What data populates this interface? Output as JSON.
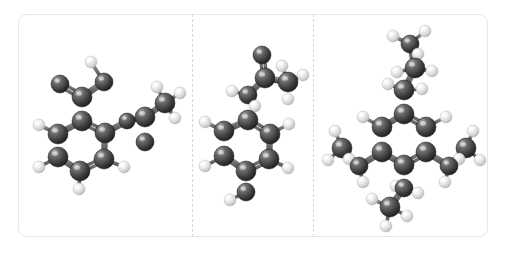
{
  "viewer": {
    "background_color": "#ffffff",
    "frame_border_color": "#e6e6e6",
    "divider_color": "#d8d8d8",
    "panel_count": 3
  },
  "atom_styles": {
    "carbon": {
      "label": "C",
      "color": "#3a3a3a",
      "highlight": "#8d8d8d",
      "radius": 9
    },
    "hydrogen": {
      "label": "H",
      "color": "#d8d8d8",
      "highlight": "#ffffff",
      "radius": 6
    },
    "bond_color": "#6e6e6e"
  },
  "panels": [
    {
      "name": "panel-1",
      "molecule_name": "molecule-1",
      "atoms": [
        {
          "id": "c1",
          "element": "C",
          "x": 82,
          "y": 121,
          "r": 10
        },
        {
          "id": "c2",
          "element": "C",
          "x": 58,
          "y": 134,
          "r": 10
        },
        {
          "id": "c3",
          "element": "C",
          "x": 58,
          "y": 157,
          "r": 10
        },
        {
          "id": "c4",
          "element": "C",
          "x": 80,
          "y": 171,
          "r": 10
        },
        {
          "id": "c5",
          "element": "C",
          "x": 104,
          "y": 159,
          "r": 10
        },
        {
          "id": "c6",
          "element": "C",
          "x": 105,
          "y": 133,
          "r": 10
        },
        {
          "id": "c7",
          "element": "C",
          "x": 82,
          "y": 97,
          "r": 10
        },
        {
          "id": "o1",
          "element": "C",
          "x": 60,
          "y": 84,
          "r": 9
        },
        {
          "id": "c8",
          "element": "C",
          "x": 104,
          "y": 82,
          "r": 9
        },
        {
          "id": "c9",
          "element": "C",
          "x": 127,
          "y": 121,
          "r": 8
        },
        {
          "id": "c10",
          "element": "C",
          "x": 145,
          "y": 117,
          "r": 10
        },
        {
          "id": "o2",
          "element": "C",
          "x": 145,
          "y": 142,
          "r": 9
        },
        {
          "id": "c11",
          "element": "C",
          "x": 165,
          "y": 103,
          "r": 10
        },
        {
          "id": "h1",
          "element": "H",
          "x": 39,
          "y": 125,
          "r": 6
        },
        {
          "id": "h2",
          "element": "H",
          "x": 39,
          "y": 167,
          "r": 6
        },
        {
          "id": "h3",
          "element": "H",
          "x": 79,
          "y": 189,
          "r": 6
        },
        {
          "id": "h4",
          "element": "H",
          "x": 124,
          "y": 167,
          "r": 6
        },
        {
          "id": "h5",
          "element": "H",
          "x": 91,
          "y": 62,
          "r": 6
        },
        {
          "id": "h6",
          "element": "H",
          "x": 157,
          "y": 87,
          "r": 6
        },
        {
          "id": "h7",
          "element": "H",
          "x": 180,
          "y": 93,
          "r": 6
        },
        {
          "id": "h8",
          "element": "H",
          "x": 175,
          "y": 118,
          "r": 6
        }
      ],
      "bonds": [
        {
          "a": "c1",
          "b": "c2",
          "order": 1
        },
        {
          "a": "c2",
          "b": "c3",
          "order": 2
        },
        {
          "a": "c3",
          "b": "c4",
          "order": 1
        },
        {
          "a": "c4",
          "b": "c5",
          "order": 2
        },
        {
          "a": "c5",
          "b": "c6",
          "order": 1
        },
        {
          "a": "c6",
          "b": "c1",
          "order": 2
        },
        {
          "a": "c1",
          "b": "c7",
          "order": 1
        },
        {
          "a": "c7",
          "b": "o1",
          "order": 2
        },
        {
          "a": "c7",
          "b": "c8",
          "order": 1
        },
        {
          "a": "c6",
          "b": "c9",
          "order": 1
        },
        {
          "a": "c9",
          "b": "c10",
          "order": 1
        },
        {
          "a": "c10",
          "b": "o2",
          "order": 2
        },
        {
          "a": "c10",
          "b": "c11",
          "order": 1
        },
        {
          "a": "c2",
          "b": "h1",
          "order": 1
        },
        {
          "a": "c3",
          "b": "h2",
          "order": 1
        },
        {
          "a": "c4",
          "b": "h3",
          "order": 1
        },
        {
          "a": "c5",
          "b": "h4",
          "order": 1
        },
        {
          "a": "c8",
          "b": "h5",
          "order": 1
        },
        {
          "a": "c11",
          "b": "h6",
          "order": 1
        },
        {
          "a": "c11",
          "b": "h7",
          "order": 1
        },
        {
          "a": "c11",
          "b": "h8",
          "order": 1
        }
      ]
    },
    {
      "name": "panel-2",
      "molecule_name": "molecule-2",
      "atoms": [
        {
          "id": "c1",
          "element": "C",
          "x": 248,
          "y": 120,
          "r": 10
        },
        {
          "id": "c2",
          "element": "C",
          "x": 224,
          "y": 131,
          "r": 10
        },
        {
          "id": "c3",
          "element": "C",
          "x": 224,
          "y": 156,
          "r": 10
        },
        {
          "id": "c4",
          "element": "C",
          "x": 246,
          "y": 171,
          "r": 10
        },
        {
          "id": "c5",
          "element": "C",
          "x": 269,
          "y": 159,
          "r": 10
        },
        {
          "id": "c6",
          "element": "C",
          "x": 270,
          "y": 134,
          "r": 10
        },
        {
          "id": "c7",
          "element": "C",
          "x": 248,
          "y": 95,
          "r": 9
        },
        {
          "id": "c8",
          "element": "C",
          "x": 265,
          "y": 78,
          "r": 10
        },
        {
          "id": "o1",
          "element": "C",
          "x": 262,
          "y": 55,
          "r": 9
        },
        {
          "id": "c9",
          "element": "C",
          "x": 288,
          "y": 82,
          "r": 10
        },
        {
          "id": "c10",
          "element": "C",
          "x": 246,
          "y": 192,
          "r": 9
        },
        {
          "id": "h1",
          "element": "H",
          "x": 205,
          "y": 122,
          "r": 6
        },
        {
          "id": "h2",
          "element": "H",
          "x": 205,
          "y": 166,
          "r": 6
        },
        {
          "id": "h3",
          "element": "H",
          "x": 288,
          "y": 168,
          "r": 6
        },
        {
          "id": "h4",
          "element": "H",
          "x": 289,
          "y": 124,
          "r": 6
        },
        {
          "id": "h5",
          "element": "H",
          "x": 232,
          "y": 91,
          "r": 6
        },
        {
          "id": "h6",
          "element": "H",
          "x": 255,
          "y": 106,
          "r": 6
        },
        {
          "id": "h7",
          "element": "H",
          "x": 282,
          "y": 66,
          "r": 6
        },
        {
          "id": "h8",
          "element": "H",
          "x": 303,
          "y": 75,
          "r": 6
        },
        {
          "id": "h9",
          "element": "H",
          "x": 288,
          "y": 99,
          "r": 6
        },
        {
          "id": "h10",
          "element": "H",
          "x": 230,
          "y": 200,
          "r": 6
        }
      ],
      "bonds": [
        {
          "a": "c1",
          "b": "c2",
          "order": 1
        },
        {
          "a": "c2",
          "b": "c3",
          "order": 2
        },
        {
          "a": "c3",
          "b": "c4",
          "order": 1
        },
        {
          "a": "c4",
          "b": "c5",
          "order": 2
        },
        {
          "a": "c5",
          "b": "c6",
          "order": 1
        },
        {
          "a": "c6",
          "b": "c1",
          "order": 2
        },
        {
          "a": "c1",
          "b": "c7",
          "order": 1
        },
        {
          "a": "c7",
          "b": "c8",
          "order": 1
        },
        {
          "a": "c8",
          "b": "o1",
          "order": 2
        },
        {
          "a": "c8",
          "b": "c9",
          "order": 1
        },
        {
          "a": "c4",
          "b": "c10",
          "order": 1
        },
        {
          "a": "c2",
          "b": "h1",
          "order": 1
        },
        {
          "a": "c3",
          "b": "h2",
          "order": 1
        },
        {
          "a": "c5",
          "b": "h3",
          "order": 1
        },
        {
          "a": "c6",
          "b": "h4",
          "order": 1
        },
        {
          "a": "c7",
          "b": "h5",
          "order": 1
        },
        {
          "a": "c7",
          "b": "h6",
          "order": 1
        },
        {
          "a": "c9",
          "b": "h7",
          "order": 1
        },
        {
          "a": "c9",
          "b": "h8",
          "order": 1
        },
        {
          "a": "c9",
          "b": "h9",
          "order": 1
        },
        {
          "a": "c10",
          "b": "h10",
          "order": 1
        }
      ]
    },
    {
      "name": "panel-3",
      "molecule_name": "molecule-3",
      "atoms": [
        {
          "id": "c1",
          "element": "C",
          "x": 404,
          "y": 114,
          "r": 10
        },
        {
          "id": "c2",
          "element": "C",
          "x": 382,
          "y": 127,
          "r": 10
        },
        {
          "id": "c3",
          "element": "C",
          "x": 382,
          "y": 152,
          "r": 10
        },
        {
          "id": "c4",
          "element": "C",
          "x": 404,
          "y": 165,
          "r": 10
        },
        {
          "id": "c5",
          "element": "C",
          "x": 426,
          "y": 152,
          "r": 10
        },
        {
          "id": "c6",
          "element": "C",
          "x": 426,
          "y": 127,
          "r": 10
        },
        {
          "id": "c7",
          "element": "C",
          "x": 404,
          "y": 90,
          "r": 10
        },
        {
          "id": "c8",
          "element": "C",
          "x": 415,
          "y": 68,
          "r": 10
        },
        {
          "id": "c9",
          "element": "C",
          "x": 410,
          "y": 44,
          "r": 9
        },
        {
          "id": "c10",
          "element": "C",
          "x": 359,
          "y": 166,
          "r": 9
        },
        {
          "id": "c11",
          "element": "C",
          "x": 342,
          "y": 148,
          "r": 10
        },
        {
          "id": "c12",
          "element": "C",
          "x": 449,
          "y": 166,
          "r": 9
        },
        {
          "id": "c13",
          "element": "C",
          "x": 466,
          "y": 148,
          "r": 10
        },
        {
          "id": "c14",
          "element": "C",
          "x": 404,
          "y": 188,
          "r": 9
        },
        {
          "id": "c15",
          "element": "C",
          "x": 390,
          "y": 207,
          "r": 10
        },
        {
          "id": "h1",
          "element": "H",
          "x": 363,
          "y": 117,
          "r": 6
        },
        {
          "id": "h2",
          "element": "H",
          "x": 446,
          "y": 117,
          "r": 6
        },
        {
          "id": "h3",
          "element": "H",
          "x": 388,
          "y": 84,
          "r": 6
        },
        {
          "id": "h4",
          "element": "H",
          "x": 422,
          "y": 89,
          "r": 6
        },
        {
          "id": "h5",
          "element": "H",
          "x": 397,
          "y": 72,
          "r": 6
        },
        {
          "id": "h6",
          "element": "H",
          "x": 432,
          "y": 71,
          "r": 6
        },
        {
          "id": "h7",
          "element": "H",
          "x": 393,
          "y": 36,
          "r": 6
        },
        {
          "id": "h8",
          "element": "H",
          "x": 425,
          "y": 31,
          "r": 6
        },
        {
          "id": "h9",
          "element": "H",
          "x": 418,
          "y": 54,
          "r": 6
        },
        {
          "id": "h10",
          "element": "H",
          "x": 363,
          "y": 182,
          "r": 6
        },
        {
          "id": "h11",
          "element": "H",
          "x": 349,
          "y": 159,
          "r": 6
        },
        {
          "id": "h12",
          "element": "H",
          "x": 328,
          "y": 160,
          "r": 6
        },
        {
          "id": "h13",
          "element": "H",
          "x": 335,
          "y": 131,
          "r": 6
        },
        {
          "id": "h14",
          "element": "H",
          "x": 445,
          "y": 182,
          "r": 6
        },
        {
          "id": "h15",
          "element": "H",
          "x": 459,
          "y": 159,
          "r": 6
        },
        {
          "id": "h16",
          "element": "H",
          "x": 480,
          "y": 160,
          "r": 6
        },
        {
          "id": "h17",
          "element": "H",
          "x": 473,
          "y": 131,
          "r": 6
        },
        {
          "id": "h18",
          "element": "H",
          "x": 418,
          "y": 193,
          "r": 6
        },
        {
          "id": "h19",
          "element": "H",
          "x": 396,
          "y": 186,
          "r": 6
        },
        {
          "id": "h20",
          "element": "H",
          "x": 372,
          "y": 199,
          "r": 6
        },
        {
          "id": "h21",
          "element": "H",
          "x": 386,
          "y": 226,
          "r": 6
        },
        {
          "id": "h22",
          "element": "H",
          "x": 407,
          "y": 216,
          "r": 6
        }
      ],
      "bonds": [
        {
          "a": "c1",
          "b": "c2",
          "order": 1
        },
        {
          "a": "c2",
          "b": "c3",
          "order": 2
        },
        {
          "a": "c3",
          "b": "c4",
          "order": 1
        },
        {
          "a": "c4",
          "b": "c5",
          "order": 2
        },
        {
          "a": "c5",
          "b": "c6",
          "order": 1
        },
        {
          "a": "c6",
          "b": "c1",
          "order": 2
        },
        {
          "a": "c1",
          "b": "c7",
          "order": 1
        },
        {
          "a": "c7",
          "b": "c8",
          "order": 1
        },
        {
          "a": "c8",
          "b": "c9",
          "order": 1
        },
        {
          "a": "c3",
          "b": "c10",
          "order": 1
        },
        {
          "a": "c10",
          "b": "c11",
          "order": 1
        },
        {
          "a": "c5",
          "b": "c12",
          "order": 1
        },
        {
          "a": "c12",
          "b": "c13",
          "order": 1
        },
        {
          "a": "c4",
          "b": "c14",
          "order": 1
        },
        {
          "a": "c14",
          "b": "c15",
          "order": 1
        },
        {
          "a": "c2",
          "b": "h1",
          "order": 1
        },
        {
          "a": "c6",
          "b": "h2",
          "order": 1
        },
        {
          "a": "c7",
          "b": "h3",
          "order": 1
        },
        {
          "a": "c7",
          "b": "h4",
          "order": 1
        },
        {
          "a": "c8",
          "b": "h5",
          "order": 1
        },
        {
          "a": "c8",
          "b": "h6",
          "order": 1
        },
        {
          "a": "c9",
          "b": "h7",
          "order": 1
        },
        {
          "a": "c9",
          "b": "h8",
          "order": 1
        },
        {
          "a": "c9",
          "b": "h9",
          "order": 1
        },
        {
          "a": "c10",
          "b": "h10",
          "order": 1
        },
        {
          "a": "c10",
          "b": "h11",
          "order": 1
        },
        {
          "a": "c11",
          "b": "h12",
          "order": 1
        },
        {
          "a": "c11",
          "b": "h13",
          "order": 1
        },
        {
          "a": "c12",
          "b": "h14",
          "order": 1
        },
        {
          "a": "c12",
          "b": "h15",
          "order": 1
        },
        {
          "a": "c13",
          "b": "h16",
          "order": 1
        },
        {
          "a": "c13",
          "b": "h17",
          "order": 1
        },
        {
          "a": "c14",
          "b": "h18",
          "order": 1
        },
        {
          "a": "c14",
          "b": "h19",
          "order": 1
        },
        {
          "a": "c15",
          "b": "h20",
          "order": 1
        },
        {
          "a": "c15",
          "b": "h21",
          "order": 1
        },
        {
          "a": "c15",
          "b": "h22",
          "order": 1
        }
      ]
    }
  ]
}
